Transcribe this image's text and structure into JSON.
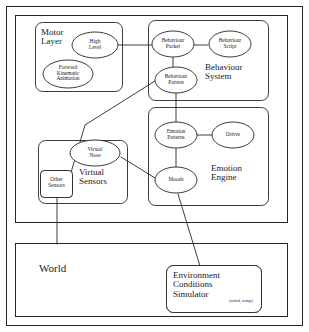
{
  "diagram": {
    "stroke_color": "#262626",
    "background_color": "#ffffff",
    "outer_frame": {
      "label": ""
    },
    "agent_container": {
      "label": ""
    },
    "groups": {
      "motor_layer": {
        "label": "Motor\nLayer",
        "nodes": {
          "high_level": {
            "label": "High\nLevel"
          },
          "forward_kinematic_animation": {
            "label": "Forward\nKinematic\nAnimation"
          }
        }
      },
      "behaviour_system": {
        "label": "Behaviour\nSystem",
        "nodes": {
          "behaviour_packet": {
            "label": "Behaviour\nPacket"
          },
          "behaviour_script": {
            "label": "Behaviour\nScript"
          },
          "behaviour_pattern": {
            "label": "Behaviour\nPattern"
          }
        }
      },
      "emotion_engine": {
        "label": "Emotion\nEngine",
        "nodes": {
          "emotion_patterns": {
            "label": "Emotion\nPatterns"
          },
          "drives": {
            "label": "Drives"
          },
          "moods": {
            "label": "Moods"
          }
        }
      },
      "virtual_sensors": {
        "label": "Virtual\nSensors",
        "nodes": {
          "virtual_nose": {
            "label": "Virtual\nNose"
          },
          "other_sensors": {
            "label": "Other\nSensors"
          }
        }
      },
      "world": {
        "label": "World",
        "nodes": {
          "environment_conditions_simulator": {
            "label": "Environment\nConditions\nSimulator",
            "annotation": "(wind, temp)"
          }
        }
      }
    },
    "connections": [
      {
        "from": "high_level",
        "to": "behaviour_packet"
      },
      {
        "from": "behaviour_packet",
        "to": "behaviour_script"
      },
      {
        "from": "behaviour_packet",
        "to": "behaviour_pattern"
      },
      {
        "from": "behaviour_pattern",
        "to": "emotion_patterns"
      },
      {
        "from": "behaviour_pattern",
        "to": "other_sensors"
      },
      {
        "from": "emotion_patterns",
        "to": "drives"
      },
      {
        "from": "emotion_patterns",
        "to": "moods"
      },
      {
        "from": "virtual_nose",
        "to": "moods"
      },
      {
        "from": "moods",
        "to": "environment_conditions_simulator"
      },
      {
        "from": "other_sensors",
        "to": "world"
      }
    ]
  }
}
